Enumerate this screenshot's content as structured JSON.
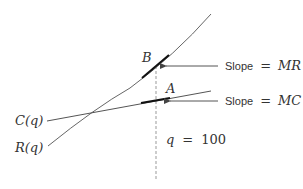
{
  "diagram": {
    "curves": {
      "revenue": {
        "label": "R(q)",
        "color": "#666666"
      },
      "cost": {
        "label": "C(q)",
        "color": "#555555"
      }
    },
    "points": {
      "B": {
        "label": "B"
      },
      "A": {
        "label": "A"
      }
    },
    "annotations": {
      "slope_mr": {
        "prefix": "Slope",
        "eq": "=",
        "value": "MR"
      },
      "slope_mc": {
        "prefix": "Slope",
        "eq": "=",
        "value": "MC"
      },
      "q_marker": {
        "var": "q",
        "eq": "=",
        "value": "100"
      }
    },
    "colors": {
      "line": "#666666",
      "tangent": "#111111",
      "dashed": "#999999",
      "arrow": "#555555",
      "text": "#333333"
    }
  }
}
